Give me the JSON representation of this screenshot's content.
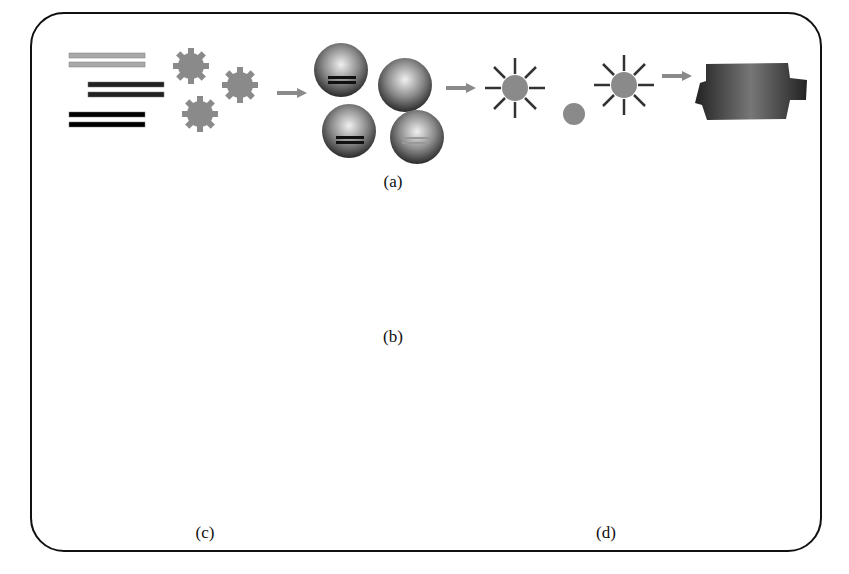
{
  "figure": {
    "panels": [
      {
        "id": "a",
        "label": "(a)",
        "description": "DNA fragments and beads encapsulated in emulsion droplets, amplified onto beads, then loaded into a picotiter plate"
      },
      {
        "id": "b",
        "label": "(b)",
        "description": "Bridge amplification on a flow-cell surface forming clusters"
      },
      {
        "id": "c",
        "label": "(c)",
        "description": "Sequencing-by-synthesis extension of surface-bound strands"
      },
      {
        "id": "d",
        "label": "(d)",
        "description": "Single DNA molecule with polymerase on a surface"
      }
    ],
    "colors": {
      "frame": "#111111",
      "arrow": "#8a8a8a",
      "bead": "#8c8c8c",
      "strand_dark": "#3a3a3a",
      "strand_light": "#bdbdbd"
    }
  }
}
